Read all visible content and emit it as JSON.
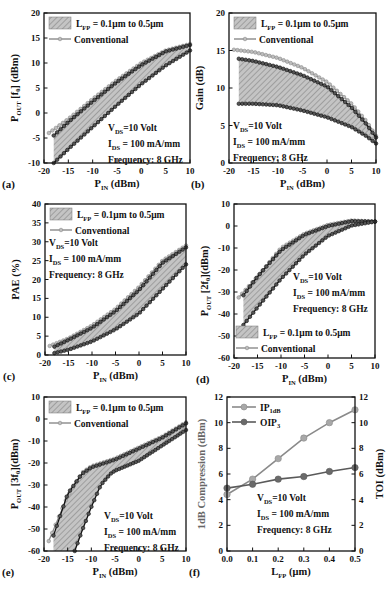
{
  "figure": {
    "conditions": {
      "vds": "10 Volt",
      "ids": "100 mA/mm",
      "frequency": "Frequency: 8 GHz"
    },
    "legend": {
      "band_label": "= 0.1μm to 0.5μm",
      "band_prefix": "L",
      "band_sub": "FP",
      "conventional_label": "Conventional"
    },
    "colors": {
      "band_fill": "#b8b8b8",
      "hatch": "#7a7a7a",
      "conventional": "#8a8a8a",
      "fp_curve": "#111111",
      "ip1db": "#8a8a8a",
      "oip3": "#5a5a5a"
    }
  },
  "chart_data": [
    {
      "panel": "(a)",
      "type": "line",
      "xlabel": "PIN (dBm)",
      "ylabel": "POUT [f0] (dBm)",
      "xlim": [
        -20,
        10
      ],
      "ylim": [
        -10,
        20
      ],
      "xticks": [
        -20,
        -15,
        -10,
        -5,
        0,
        5,
        10
      ],
      "yticks": [
        -10,
        -5,
        0,
        5,
        10,
        15,
        20
      ],
      "annotation_pos": "bottom-right",
      "legend_pos": "top-left",
      "series": [
        {
          "name": "Conventional",
          "x": [
            -19,
            -15,
            -10,
            -5,
            0,
            5,
            10
          ],
          "y": [
            -4,
            -1.2,
            2.8,
            6.6,
            10,
            12.5,
            13.8
          ]
        },
        {
          "name": "LFP = 0.1μm (upper)",
          "x": [
            -18,
            -15,
            -10,
            -5,
            0,
            5,
            10
          ],
          "y": [
            -4.5,
            -1.8,
            2.3,
            6.2,
            9.6,
            12.3,
            13.6
          ]
        },
        {
          "name": "LFP = 0.5μm (lower)",
          "x": [
            -18,
            -15,
            -10,
            -5,
            0,
            5,
            10
          ],
          "y": [
            -10,
            -7.2,
            -2.8,
            1.6,
            5.8,
            9.5,
            12.5
          ]
        }
      ]
    },
    {
      "panel": "(b)",
      "type": "line",
      "xlabel": "PIN (dBm)",
      "ylabel": "Gain (dB)",
      "xlim": [
        -20,
        10
      ],
      "ylim": [
        0,
        20
      ],
      "xticks": [
        -20,
        -15,
        -10,
        -5,
        0,
        5,
        10
      ],
      "yticks": [
        0,
        5,
        10,
        15,
        20
      ],
      "annotation_pos": "bottom-left",
      "legend_pos": "top-left",
      "series": [
        {
          "name": "Conventional",
          "x": [
            -19,
            -15,
            -10,
            -5,
            0,
            5,
            8,
            10
          ],
          "y": [
            15.1,
            14.8,
            14,
            12.7,
            10.8,
            7.9,
            5.6,
            3.6
          ]
        },
        {
          "name": "LFP = 0.1μm (upper)",
          "x": [
            -18,
            -15,
            -10,
            -5,
            0,
            5,
            8,
            10
          ],
          "y": [
            13.9,
            13.6,
            12.8,
            11.7,
            10.2,
            7.4,
            5.2,
            3.4
          ]
        },
        {
          "name": "LFP = 0.5μm (lower)",
          "x": [
            -18,
            -15,
            -10,
            -5,
            0,
            5,
            8,
            10
          ],
          "y": [
            7.9,
            7.9,
            7.7,
            7.0,
            6.1,
            4.8,
            3.6,
            2.6
          ]
        }
      ]
    },
    {
      "panel": "(c)",
      "type": "line",
      "xlabel": "PIN (dBm)",
      "ylabel": "PAE (%)",
      "xlim": [
        -20,
        10
      ],
      "ylim": [
        0,
        40
      ],
      "xticks": [
        -20,
        -15,
        -10,
        -5,
        0,
        5,
        10
      ],
      "yticks": [
        0,
        5,
        10,
        15,
        20,
        25,
        30,
        35,
        40
      ],
      "annotation_pos": "top-left",
      "legend_pos": "top-left",
      "series": [
        {
          "name": "Conventional",
          "x": [
            -19,
            -15,
            -10,
            -5,
            0,
            5,
            10
          ],
          "y": [
            2.4,
            4.4,
            7.8,
            12.2,
            18,
            25,
            29
          ]
        },
        {
          "name": "LFP = 0.1μm (upper)",
          "x": [
            -18,
            -15,
            -10,
            -5,
            0,
            5,
            10
          ],
          "y": [
            2.2,
            4.0,
            7.2,
            11.6,
            17.2,
            24.4,
            28.5
          ]
        },
        {
          "name": "LFP = 0.5μm (lower)",
          "x": [
            -18,
            -15,
            -10,
            -5,
            0,
            5,
            10
          ],
          "y": [
            0.5,
            1.4,
            3.6,
            6.8,
            11,
            17.5,
            24
          ]
        }
      ]
    },
    {
      "panel": "(d)",
      "type": "line",
      "xlabel": "PIN (dBm)",
      "ylabel": "POUT [2f0] (dBm)",
      "xlim": [
        -20,
        10
      ],
      "ylim": [
        -60,
        10
      ],
      "xticks": [
        -20,
        -15,
        -10,
        -5,
        0,
        5,
        10
      ],
      "yticks": [
        -60,
        -50,
        -40,
        -30,
        -20,
        -10,
        0,
        10
      ],
      "annotation_pos": "middle-right",
      "legend_pos": "bottom-left",
      "series": [
        {
          "name": "Conventional",
          "x": [
            -19,
            -15,
            -10,
            -5,
            0,
            5,
            10
          ],
          "y": [
            -32.5,
            -23,
            -10,
            -3.5,
            0.5,
            2.5,
            2
          ]
        },
        {
          "name": "LFP = 0.1μm (upper)",
          "x": [
            -18,
            -15,
            -10,
            -5,
            0,
            5,
            10
          ],
          "y": [
            -31.5,
            -23,
            -11,
            -4,
            0,
            2.2,
            2
          ]
        },
        {
          "name": "LFP = 0.5μm (lower)",
          "x": [
            -18,
            -15,
            -10,
            -5,
            0,
            5,
            10
          ],
          "y": [
            -45,
            -37,
            -24,
            -13,
            -4.5,
            0.2,
            2
          ]
        }
      ]
    },
    {
      "panel": "(e)",
      "type": "line",
      "xlabel": "PIN (dBm)",
      "ylabel": "POUT [3f0] (dBm)",
      "xlim": [
        -20,
        10
      ],
      "ylim": [
        -60,
        10
      ],
      "xticks": [
        -20,
        -15,
        -10,
        -5,
        0,
        5,
        10
      ],
      "yticks": [
        -60,
        -50,
        -40,
        -30,
        -20,
        -10,
        0,
        10
      ],
      "annotation_pos": "bottom-right",
      "legend_pos": "top-left",
      "series": [
        {
          "name": "Conventional",
          "x": [
            -19,
            -15,
            -12,
            -10,
            -5,
            0,
            5,
            10
          ],
          "y": [
            -55.5,
            -35,
            -24.5,
            -21.5,
            -18,
            -13,
            -8,
            -1.5
          ]
        },
        {
          "name": "LFP = 0.1μm (upper)",
          "x": [
            -18,
            -15,
            -12,
            -10,
            -5,
            0,
            5,
            10
          ],
          "y": [
            -53,
            -34,
            -25,
            -22,
            -18.5,
            -13.5,
            -8.5,
            -2
          ]
        },
        {
          "name": "LFP = 0.5μm (lower)",
          "x": [
            -13.5,
            -12,
            -10,
            -8,
            -6,
            -5,
            0,
            5,
            10
          ],
          "y": [
            -60,
            -51,
            -40,
            -30,
            -25,
            -23.5,
            -19,
            -12,
            -5
          ]
        }
      ]
    },
    {
      "panel": "(f)",
      "type": "line",
      "xlabel": "LFP (μm)",
      "ylabel": "1dB Compression (dBm)",
      "ylabel_right": "TOI (dBm)",
      "xlim": [
        0,
        0.5
      ],
      "ylim": [
        0,
        12
      ],
      "ylim_right": [
        0,
        12
      ],
      "xticks": [
        0.0,
        0.1,
        0.2,
        0.3,
        0.4,
        0.5
      ],
      "yticks": [
        0,
        2,
        4,
        6,
        8,
        10,
        12
      ],
      "annotation_pos": "bottom-right",
      "legend_pos": "top-left",
      "series": [
        {
          "name": "IP1dB",
          "x": [
            0.0,
            0.1,
            0.2,
            0.3,
            0.4,
            0.5
          ],
          "y": [
            4.4,
            5.6,
            7.2,
            8.8,
            10.0,
            11.0
          ]
        },
        {
          "name": "OIP3",
          "x": [
            0.0,
            0.1,
            0.2,
            0.3,
            0.4,
            0.5
          ],
          "y": [
            4.9,
            5.2,
            5.6,
            5.8,
            6.2,
            6.5
          ]
        }
      ]
    }
  ]
}
